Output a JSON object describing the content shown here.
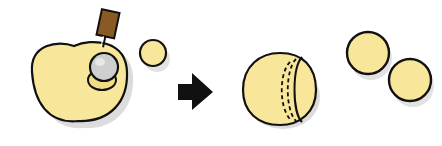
{
  "diagram": {
    "colors": {
      "fruit_fill": "#f8e79a",
      "outline": "#111111",
      "shadow": "#d6d6d6",
      "handle": "#8a5a24",
      "scoop_metal": "#c8c8c8",
      "arrow": "#111111"
    },
    "steps": [
      {
        "id": "scooping",
        "elements": [
          "melon-half",
          "melon-baller-tool",
          "small-melon-ball"
        ]
      },
      {
        "id": "arrow",
        "elements": [
          "right-arrow"
        ]
      },
      {
        "id": "result",
        "elements": [
          "scooped-melon",
          "melon-ball-1",
          "melon-ball-2"
        ]
      }
    ]
  }
}
